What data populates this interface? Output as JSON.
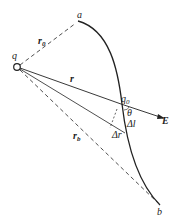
{
  "diagram": {
    "type": "physics-electric-field-work",
    "labels": {
      "charge": "q",
      "point_a": "a",
      "point_b": "b",
      "test_charge": "q",
      "test_charge_sub": "0",
      "r0": "r",
      "r0_sub": "0",
      "r": "r",
      "rb": "r",
      "rb_sub": "b",
      "field": "E",
      "theta": "θ",
      "delta_l": "Δl",
      "delta_r": "Δr"
    },
    "colors": {
      "stroke": "#222222",
      "background": "#ffffff"
    }
  }
}
